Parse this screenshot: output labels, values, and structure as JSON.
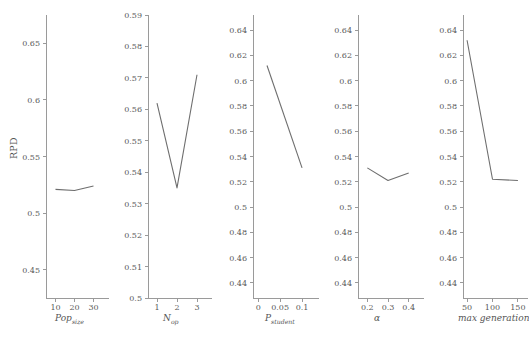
{
  "figure": {
    "ylabel": "RPD",
    "line_color": "#6e6e6e",
    "axis_color": "#9a9a9a",
    "text_color": "#555555",
    "background": "#ffffff"
  },
  "chart_data": [
    {
      "type": "line",
      "title": "",
      "xlabel": "Pop",
      "xlabel_sub": "size",
      "ylabel": "RPD",
      "x": [
        10,
        20,
        30
      ],
      "values": [
        0.521,
        0.52,
        0.524
      ],
      "xticks": [
        10,
        20,
        30
      ],
      "xtick_labels": [
        "10",
        "20",
        "30"
      ],
      "yticks": [
        0.45,
        0.5,
        0.55,
        0.6,
        0.65
      ],
      "ytick_labels": [
        "0.45",
        "0.5",
        "0.55",
        "0.6",
        "0.65"
      ],
      "xlim": [
        5,
        35
      ],
      "ylim": [
        0.425,
        0.675
      ],
      "grid": false,
      "legend": "none"
    },
    {
      "type": "line",
      "title": "",
      "xlabel": "N",
      "xlabel_sub": "op",
      "ylabel": "RPD",
      "x": [
        1,
        2,
        3
      ],
      "values": [
        0.562,
        0.535,
        0.571
      ],
      "xticks": [
        1,
        2,
        3
      ],
      "xtick_labels": [
        "1",
        "2",
        "3"
      ],
      "yticks": [
        0.5,
        0.51,
        0.52,
        0.53,
        0.54,
        0.55,
        0.56,
        0.57,
        0.58,
        0.59
      ],
      "ytick_labels": [
        "0.5",
        "0.51",
        "0.52",
        "0.53",
        "0.54",
        "0.55",
        "0.56",
        "0.57",
        "0.58",
        "0.59"
      ],
      "xlim": [
        0.55,
        3.45
      ],
      "ylim": [
        0.5,
        0.59
      ],
      "grid": false,
      "legend": "none"
    },
    {
      "type": "line",
      "title": "",
      "xlabel": "P",
      "xlabel_sub": "student",
      "ylabel": "RPD",
      "x": [
        0.02,
        0.1
      ],
      "values": [
        0.612,
        0.531
      ],
      "xticks": [
        0,
        0.05,
        0.1
      ],
      "xtick_labels": [
        "0",
        "0.05",
        "0.1"
      ],
      "yticks": [
        0.44,
        0.46,
        0.48,
        0.5,
        0.52,
        0.54,
        0.56,
        0.58,
        0.6,
        0.62,
        0.64
      ],
      "ytick_labels": [
        "0.44",
        "0.46",
        "0.48",
        "0.5",
        "0.52",
        "0.54",
        "0.56",
        "0.58",
        "0.6",
        "0.62",
        "0.64"
      ],
      "xlim": [
        -0.012,
        0.125
      ],
      "ylim": [
        0.428,
        0.652
      ],
      "grid": false,
      "legend": "none"
    },
    {
      "type": "line",
      "title": "",
      "xlabel": "α",
      "xlabel_sub": "",
      "ylabel": "RPD",
      "x": [
        0.2,
        0.3,
        0.4
      ],
      "values": [
        0.531,
        0.521,
        0.527
      ],
      "xticks": [
        0.2,
        0.3,
        0.4
      ],
      "xtick_labels": [
        "0.2",
        "0.3",
        "0.4"
      ],
      "yticks": [
        0.44,
        0.46,
        0.48,
        0.5,
        0.52,
        0.54,
        0.56,
        0.58,
        0.6,
        0.62,
        0.64
      ],
      "ytick_labels": [
        "0.44",
        "0.46",
        "0.48",
        "0.5",
        "0.52",
        "0.54",
        "0.56",
        "0.58",
        "0.6",
        "0.62",
        "0.64"
      ],
      "xlim": [
        0.155,
        0.445
      ],
      "ylim": [
        0.428,
        0.652
      ],
      "grid": false,
      "legend": "none"
    },
    {
      "type": "line",
      "title": "",
      "xlabel": "max generation",
      "xlabel_sub": "",
      "ylabel": "RPD",
      "x": [
        50,
        100,
        150
      ],
      "values": [
        0.632,
        0.522,
        0.521
      ],
      "xticks": [
        50,
        100,
        150
      ],
      "xtick_labels": [
        "50",
        "100",
        "150"
      ],
      "yticks": [
        0.44,
        0.46,
        0.48,
        0.5,
        0.52,
        0.54,
        0.56,
        0.58,
        0.6,
        0.62,
        0.64
      ],
      "ytick_labels": [
        "0.44",
        "0.46",
        "0.48",
        "0.5",
        "0.52",
        "0.54",
        "0.56",
        "0.58",
        "0.6",
        "0.62",
        "0.64"
      ],
      "xlim": [
        42,
        158
      ],
      "ylim": [
        0.428,
        0.652
      ],
      "grid": false,
      "legend": "none"
    }
  ]
}
